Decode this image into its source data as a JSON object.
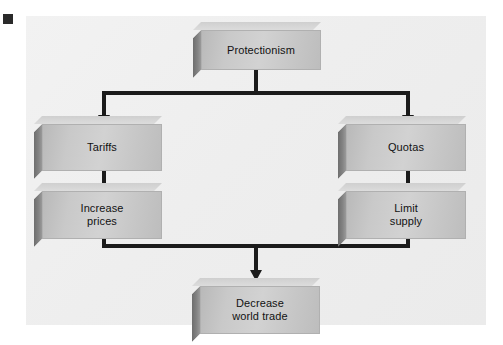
{
  "diagram": {
    "title_marker": "black-square-marker",
    "type": "flowchart",
    "background_color": "#efefef",
    "box_fill_color": "#c9c9c9",
    "box_side_color": "#7a7a7a",
    "connector_color": "#1b1b1b",
    "nodes": [
      {
        "id": "protectionism",
        "label": "Protectionism",
        "level": 0
      },
      {
        "id": "tariffs",
        "label": "Tariffs",
        "level": 1
      },
      {
        "id": "quotas",
        "label": "Quotas",
        "level": 1
      },
      {
        "id": "increase-prices",
        "label": "Increase\nprices",
        "level": 2
      },
      {
        "id": "limit-supply",
        "label": "Limit\nsupply",
        "level": 2
      },
      {
        "id": "decrease-world-trade",
        "label": "Decrease\nworld trade",
        "level": 3
      }
    ],
    "edges": [
      {
        "from": "protectionism",
        "to": "tariffs"
      },
      {
        "from": "protectionism",
        "to": "quotas"
      },
      {
        "from": "tariffs",
        "to": "increase-prices"
      },
      {
        "from": "quotas",
        "to": "limit-supply"
      },
      {
        "from": "increase-prices",
        "to": "decrease-world-trade"
      },
      {
        "from": "limit-supply",
        "to": "decrease-world-trade"
      }
    ]
  }
}
